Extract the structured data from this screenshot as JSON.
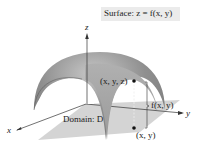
{
  "figure": {
    "title": "Surface: z = f(x, y)",
    "axes": {
      "x": "x",
      "y": "y",
      "z": "z"
    },
    "labels": {
      "point_3d": "(x, y, z)",
      "point_2d": "(x, y)",
      "height": "f(x, y)",
      "domain": "Domain: D"
    },
    "colors": {
      "surface_outer": "#8a8a8a",
      "surface_inner": "#a8a8a8",
      "domain_fill": "#d4d4d4",
      "title_bg": "#ebebeb",
      "ink": "#222222"
    }
  }
}
